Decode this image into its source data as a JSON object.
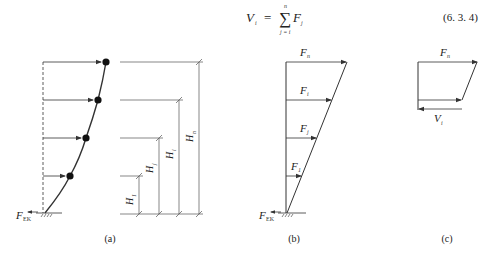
{
  "equation": {
    "lhs": "V",
    "lhs_sub": "i",
    "equals": "=",
    "sum_symbol": "∑",
    "sum_upper": "n",
    "sum_lower": "j = i",
    "term": "F",
    "term_sub": "j",
    "number": "(6. 3. 4)"
  },
  "panel_a": {
    "caption": "(a)",
    "base_force_label": "F",
    "base_force_sub": "EK",
    "height_labels": [
      {
        "label": "H",
        "sub": "1"
      },
      {
        "label": "H",
        "sub": "j"
      },
      {
        "label": "H",
        "sub": "i"
      },
      {
        "label": "H",
        "sub": "n"
      }
    ]
  },
  "panel_b": {
    "caption": "(b)",
    "base_force_label": "F",
    "base_force_sub": "EK",
    "force_labels": [
      {
        "label": "F",
        "sub": "n"
      },
      {
        "label": "F",
        "sub": "i"
      },
      {
        "label": "F",
        "sub": "j"
      },
      {
        "label": "F",
        "sub": "1"
      }
    ]
  },
  "panel_c": {
    "caption": "(c)",
    "top_force_label": "F",
    "top_force_sub": "n",
    "shear_label": "V",
    "shear_sub": "i"
  },
  "colors": {
    "line": "#333333",
    "background": "#ffffff"
  }
}
